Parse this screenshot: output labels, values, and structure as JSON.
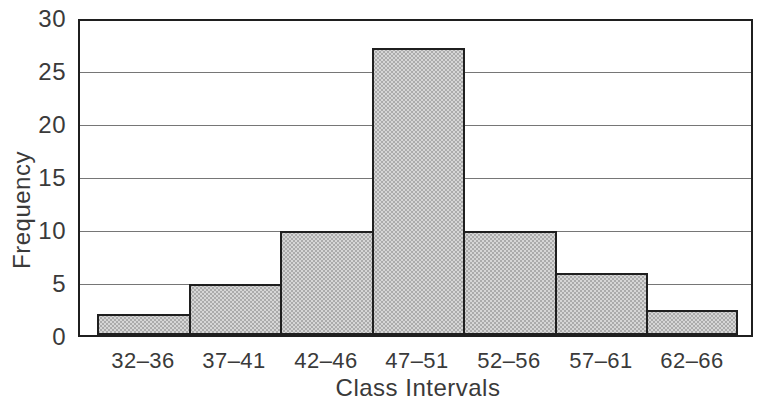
{
  "chart_data": {
    "type": "bar",
    "subtype": "histogram",
    "title": "",
    "xlabel": "Class Intervals",
    "ylabel": "Frequency",
    "categories": [
      "32–36",
      "37–41",
      "42–46",
      "47–51",
      "52–56",
      "57–61",
      "62–66"
    ],
    "values": [
      2.2,
      5,
      10,
      27.3,
      10,
      6,
      2.5
    ],
    "ylim": [
      0,
      30
    ],
    "yticks": [
      0,
      5,
      10,
      15,
      20,
      25,
      30
    ],
    "ytick_labels": [
      "0",
      "5",
      "10",
      "15",
      "20",
      "25",
      "30"
    ],
    "grid": "horizontal",
    "legend": "none",
    "colors": {
      "bar_fill": "#d0d0d0",
      "bar_border": "#1f1f1f",
      "gridline": "#767676",
      "frame": "#1f1f1f",
      "text": "#3a3a3a",
      "background": "#ffffff"
    }
  }
}
